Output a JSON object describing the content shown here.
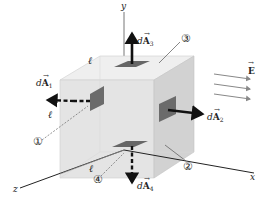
{
  "figure": {
    "axes": {
      "x": "x",
      "y": "y",
      "z": "z"
    },
    "edge_label": "ℓ",
    "field": {
      "symbol": "E",
      "arrow_count": 3,
      "direction": "+x"
    },
    "surfaces": [
      {
        "id": "1",
        "marker": "①",
        "vector_prefix": "d",
        "vector_symbol": "A",
        "subscript": "1",
        "face": "left (−x)",
        "arrow_direction": "−x"
      },
      {
        "id": "2",
        "marker": "②",
        "vector_prefix": "d",
        "vector_symbol": "A",
        "subscript": "2",
        "face": "right (+x)",
        "arrow_direction": "+x"
      },
      {
        "id": "3",
        "marker": "③",
        "vector_prefix": "d",
        "vector_symbol": "A",
        "subscript": "3",
        "face": "top (+y)",
        "arrow_direction": "+y"
      },
      {
        "id": "4",
        "marker": "④",
        "vector_prefix": "d",
        "vector_symbol": "A",
        "subscript": "4",
        "face": "bottom (−y)",
        "arrow_direction": "−y"
      }
    ]
  },
  "colors": {
    "cube_front": "#e6e6e6",
    "cube_top": "#efefef",
    "cube_side": "#d4d4d4",
    "patch": "#6b6b6b",
    "arrow": "#111111",
    "field_arrow": "#888888"
  }
}
